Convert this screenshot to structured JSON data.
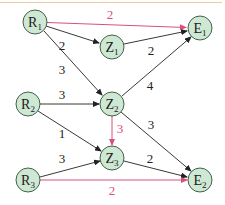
{
  "colors": {
    "node_fill": "#cfe8d3",
    "node_stroke": "#2f4f3a",
    "edge_black": "#222222",
    "edge_red": "#d9507a",
    "top_rule": "#f0c9a0"
  },
  "nodes": [
    {
      "id": "R1",
      "letter": "R",
      "sub": "1",
      "x": 35,
      "y": 22
    },
    {
      "id": "Z1",
      "letter": "Z",
      "sub": "1",
      "x": 112,
      "y": 47
    },
    {
      "id": "E1",
      "letter": "E",
      "sub": "1",
      "x": 200,
      "y": 28
    },
    {
      "id": "R2",
      "letter": "R",
      "sub": "2",
      "x": 28,
      "y": 104
    },
    {
      "id": "Z2",
      "letter": "Z",
      "sub": "2",
      "x": 112,
      "y": 104
    },
    {
      "id": "Z3",
      "letter": "Z",
      "sub": "3",
      "x": 112,
      "y": 158
    },
    {
      "id": "R3",
      "letter": "R",
      "sub": "3",
      "x": 28,
      "y": 180
    },
    {
      "id": "E2",
      "letter": "E",
      "sub": "2",
      "x": 200,
      "y": 180
    }
  ],
  "edges": [
    {
      "from": "R1",
      "to": "E1",
      "weight": "2",
      "color": "red"
    },
    {
      "from": "R1",
      "to": "Z1",
      "weight": "2",
      "color": "black"
    },
    {
      "from": "R1",
      "to": "Z2",
      "weight": "3",
      "color": "black"
    },
    {
      "from": "Z1",
      "to": "E1",
      "weight": "2",
      "color": "black"
    },
    {
      "from": "Z2",
      "to": "E1",
      "weight": "4",
      "color": "black"
    },
    {
      "from": "R2",
      "to": "Z2",
      "weight": "3",
      "color": "black"
    },
    {
      "from": "R2",
      "to": "Z3",
      "weight": "1",
      "color": "black"
    },
    {
      "from": "Z2",
      "to": "Z3",
      "weight": "3",
      "color": "red"
    },
    {
      "from": "Z2",
      "to": "E2",
      "weight": "3",
      "color": "black"
    },
    {
      "from": "R3",
      "to": "Z3",
      "weight": "3",
      "color": "black"
    },
    {
      "from": "Z3",
      "to": "E2",
      "weight": "2",
      "color": "black"
    },
    {
      "from": "R3",
      "to": "E2",
      "weight": "2",
      "color": "red"
    }
  ],
  "labels": {
    "R1_E1": "2",
    "R1_Z1": "2",
    "R1_Z2": "3",
    "Z1_E1": "2",
    "Z2_E1": "4",
    "R2_Z2": "3",
    "R2_Z3": "1",
    "Z2_Z3": "3",
    "Z2_E2": "3",
    "R3_Z3": "3",
    "Z3_E2": "2",
    "R3_E2": "2"
  },
  "node_text": {
    "R1": {
      "letter": "R",
      "sub": "1"
    },
    "Z1": {
      "letter": "Z",
      "sub": "1"
    },
    "E1": {
      "letter": "E",
      "sub": "1"
    },
    "R2": {
      "letter": "R",
      "sub": "2"
    },
    "Z2": {
      "letter": "Z",
      "sub": "2"
    },
    "Z3": {
      "letter": "Z",
      "sub": "3"
    },
    "R3": {
      "letter": "R",
      "sub": "3"
    },
    "E2": {
      "letter": "E",
      "sub": "2"
    }
  }
}
